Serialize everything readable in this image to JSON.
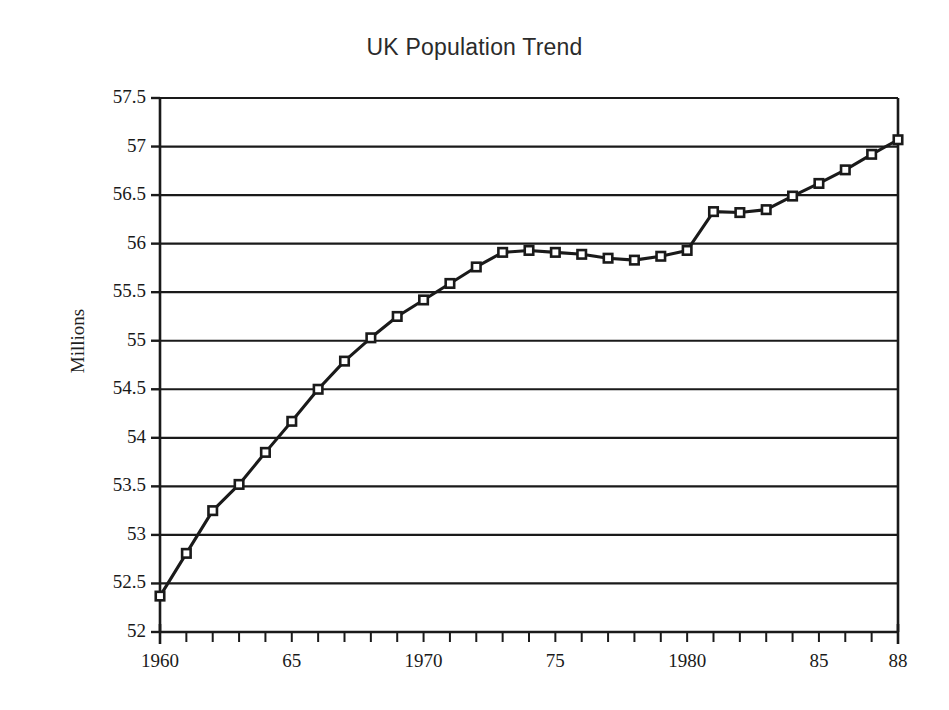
{
  "chart_data": {
    "type": "line",
    "title": "UK Population Trend",
    "xlabel": "",
    "ylabel": "Millions",
    "ylim": [
      52,
      57.5
    ],
    "xlim": [
      1960,
      1988
    ],
    "ytick_step": 0.5,
    "grid": "horizontal",
    "legend": "none",
    "marker": "open-square",
    "line_color": "#1a1a1a",
    "grid_color": "#1a1a1a",
    "background_color": "#ffffff",
    "yticks": [
      "52",
      "52.5",
      "53",
      "53.5",
      "54",
      "54.5",
      "55",
      "55.5",
      "56",
      "56.5",
      "57",
      "57.5"
    ],
    "ytick_values": [
      52,
      52.5,
      53,
      53.5,
      54,
      54.5,
      55,
      55.5,
      56,
      56.5,
      57,
      57.5
    ],
    "xticks": [
      1960,
      1961,
      1962,
      1963,
      1964,
      1965,
      1966,
      1967,
      1968,
      1969,
      1970,
      1971,
      1972,
      1973,
      1974,
      1975,
      1976,
      1977,
      1978,
      1979,
      1980,
      1981,
      1982,
      1983,
      1984,
      1985,
      1986,
      1987,
      1988
    ],
    "xtick_labels": [
      {
        "x": 1960,
        "label": "1960"
      },
      {
        "x": 1965,
        "label": "65"
      },
      {
        "x": 1970,
        "label": "1970"
      },
      {
        "x": 1975,
        "label": "75"
      },
      {
        "x": 1980,
        "label": "1980"
      },
      {
        "x": 1985,
        "label": "85"
      },
      {
        "x": 1988,
        "label": "88"
      }
    ],
    "x": [
      1960,
      1961,
      1962,
      1963,
      1964,
      1965,
      1966,
      1967,
      1968,
      1969,
      1970,
      1971,
      1972,
      1973,
      1974,
      1975,
      1976,
      1977,
      1978,
      1979,
      1980,
      1981,
      1982,
      1983,
      1984,
      1985,
      1986,
      1987,
      1988
    ],
    "values": [
      52.37,
      52.81,
      53.25,
      53.52,
      53.85,
      54.17,
      54.5,
      54.79,
      55.03,
      55.25,
      55.42,
      55.59,
      55.76,
      55.91,
      55.93,
      55.91,
      55.89,
      55.85,
      55.83,
      55.87,
      55.93,
      56.33,
      56.32,
      56.35,
      56.49,
      56.62,
      56.76,
      56.92,
      57.07
    ],
    "series": [
      {
        "name": "UK Population",
        "values": [
          52.37,
          52.81,
          53.25,
          53.52,
          53.85,
          54.17,
          54.5,
          54.79,
          55.03,
          55.25,
          55.42,
          55.59,
          55.76,
          55.91,
          55.93,
          55.91,
          55.89,
          55.85,
          55.83,
          55.87,
          55.93,
          56.33,
          56.32,
          56.35,
          56.49,
          56.62,
          56.76,
          56.92,
          57.07
        ]
      }
    ]
  }
}
